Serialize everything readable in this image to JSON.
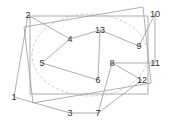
{
  "diagram": {
    "title": "",
    "colors": {
      "line": "#9a9a9a",
      "ellipse": "#b8b8b8",
      "label": "#333333",
      "background": "#ffffff"
    },
    "nodes": [
      {
        "id": "1",
        "label": "1"
      },
      {
        "id": "2",
        "label": "2"
      },
      {
        "id": "3",
        "label": "3"
      },
      {
        "id": "4",
        "label": "4"
      },
      {
        "id": "5",
        "label": "5"
      },
      {
        "id": "6",
        "label": "6"
      },
      {
        "id": "7",
        "label": "7"
      },
      {
        "id": "8",
        "label": "8"
      },
      {
        "id": "9",
        "label": "9"
      },
      {
        "id": "10",
        "label": "10"
      },
      {
        "id": "11",
        "label": "11"
      },
      {
        "id": "12",
        "label": "12"
      },
      {
        "id": "13",
        "label": "13"
      }
    ],
    "edges": [
      [
        "2",
        "4"
      ],
      [
        "4",
        "13"
      ],
      [
        "13",
        "9"
      ],
      [
        "13",
        "6"
      ],
      [
        "4",
        "5"
      ],
      [
        "5",
        "6"
      ],
      [
        "8",
        "11"
      ],
      [
        "8",
        "12"
      ],
      [
        "8",
        "7"
      ],
      [
        "7",
        "3"
      ],
      [
        "3",
        "1"
      ],
      [
        "1",
        "2"
      ],
      [
        "12",
        "7"
      ],
      [
        "9",
        "10"
      ],
      [
        "10",
        "11"
      ]
    ]
  }
}
